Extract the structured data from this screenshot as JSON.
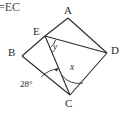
{
  "figure": {
    "caption": "=EC",
    "background_color": "#ffffff",
    "stroke_color": "#2b2b2b",
    "vertices": [
      {
        "name": "A",
        "label": "A",
        "x": 68,
        "y": 18
      },
      {
        "name": "B",
        "label": "B",
        "x": 22,
        "y": 56
      },
      {
        "name": "D",
        "label": "D",
        "x": 107,
        "y": 53
      },
      {
        "name": "C",
        "label": "C",
        "x": 70,
        "y": 95
      },
      {
        "name": "E",
        "label": "E",
        "x": 45,
        "y": 36
      }
    ],
    "segments": [
      {
        "name": "A-E",
        "from": "A",
        "to": "E"
      },
      {
        "name": "E-B",
        "from": "E",
        "to": "B"
      },
      {
        "name": "B-C",
        "from": "B",
        "to": "C"
      },
      {
        "name": "C-D",
        "from": "C",
        "to": "D"
      },
      {
        "name": "D-A",
        "from": "D",
        "to": "A"
      },
      {
        "name": "E-D",
        "from": "E",
        "to": "D"
      },
      {
        "name": "E-C",
        "from": "E",
        "to": "C"
      }
    ],
    "angles": [
      {
        "name": "angle-y-at-E",
        "label": "y",
        "vertex": "E",
        "italic": true
      },
      {
        "name": "angle-x-at-C",
        "label": "x",
        "vertex": "C",
        "italic": true
      },
      {
        "name": "angle-28-at-C",
        "label": "28°",
        "vertex": "C",
        "italic": false
      }
    ]
  }
}
